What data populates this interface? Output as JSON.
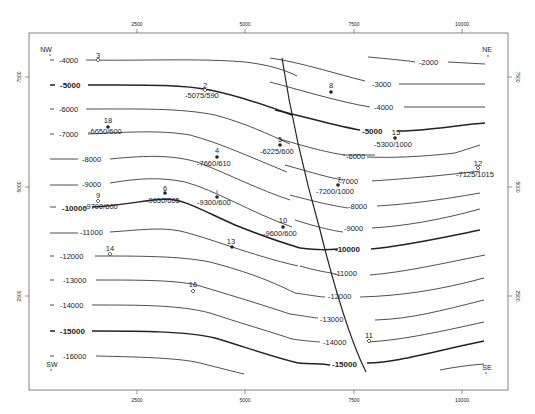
{
  "map": {
    "title": "Structure contour map",
    "frame": {
      "left": 29,
      "right": 508,
      "top": 33,
      "bottom": 390
    },
    "x_axis": {
      "ticks": [
        {
          "value": "2500",
          "px": 137
        },
        {
          "value": "5000",
          "px": 245
        },
        {
          "value": "7500",
          "px": 354
        },
        {
          "value": "10000",
          "px": 462
        }
      ]
    },
    "y_axis": {
      "ticks": [
        {
          "value": "7500",
          "py": 77
        },
        {
          "value": "5000",
          "py": 187
        },
        {
          "value": "2500",
          "py": 296
        }
      ]
    },
    "corners": {
      "nw": "NW",
      "ne": "NE",
      "sw": "SW",
      "se": "SE"
    },
    "contour_interval": 1000,
    "contours": [
      {
        "value": "-2000",
        "major": false
      },
      {
        "value": "-3000",
        "major": false
      },
      {
        "value": "-4000",
        "major": false
      },
      {
        "value": "-5000",
        "major": true
      },
      {
        "value": "-6000",
        "major": false
      },
      {
        "value": "-7000",
        "major": false
      },
      {
        "value": "-8000",
        "major": false
      },
      {
        "value": "-9000",
        "major": false
      },
      {
        "value": "-10000",
        "major": true
      },
      {
        "value": "-11000",
        "major": false
      },
      {
        "value": "-12000",
        "major": false
      },
      {
        "value": "-13000",
        "major": false
      },
      {
        "value": "-14000",
        "major": false
      },
      {
        "value": "-15000",
        "major": true
      },
      {
        "value": "-16000",
        "major": false
      }
    ],
    "left_labels": {
      "c4000": "-4000",
      "c5000": "-5000",
      "c6000": "-6000",
      "c7000": "-7000",
      "c8000": "-8000",
      "c9000": "-9000",
      "c10000": "-10000",
      "c11000": "-11000",
      "c12000": "-12000",
      "c13000": "-13000",
      "c14000": "-14000",
      "c15000": "-15000",
      "c16000": "-16000"
    },
    "right_labels": {
      "c2000": "-2000",
      "c3000": "-3000",
      "c4000": "-4000",
      "c5000": "-5000",
      "c6000": "-6000",
      "c7000": "-7000",
      "c8000": "-8000",
      "c9000": "-9000",
      "c10000": "-10000",
      "c11000": "-11000",
      "c12000": "-12000",
      "c13000": "-13000",
      "c14000": "-14000",
      "c15000": "-15000"
    },
    "wells": [
      {
        "id": "3",
        "symbol": "dry",
        "annotation": ""
      },
      {
        "id": "2",
        "symbol": "dry",
        "annotation": "-5075/590"
      },
      {
        "id": "8",
        "symbol": "producer",
        "annotation": ""
      },
      {
        "id": "18",
        "symbol": "producer",
        "annotation": "-6650/600"
      },
      {
        "id": "15",
        "symbol": "producer",
        "annotation": "-5300/1000"
      },
      {
        "id": "5",
        "symbol": "producer",
        "annotation": "-6225/600"
      },
      {
        "id": "4",
        "symbol": "producer",
        "annotation": "-7660/610"
      },
      {
        "id": "7",
        "symbol": "producer",
        "annotation": "-7200/1000"
      },
      {
        "id": "12",
        "symbol": "dry",
        "annotation": "-7125/1015"
      },
      {
        "id": "6",
        "symbol": "producer",
        "annotation": "-9650/605"
      },
      {
        "id": "1",
        "symbol": "producer",
        "annotation": "-9300/600"
      },
      {
        "id": "9",
        "symbol": "dry",
        "annotation": "-9700/600"
      },
      {
        "id": "10",
        "symbol": "producer",
        "annotation": "-9600/600"
      },
      {
        "id": "13",
        "symbol": "producer",
        "annotation": ""
      },
      {
        "id": "14",
        "symbol": "dry",
        "annotation": ""
      },
      {
        "id": "16",
        "symbol": "dry",
        "annotation": ""
      },
      {
        "id": "11",
        "symbol": "dry",
        "annotation": ""
      }
    ],
    "fault": {
      "label": "fault-trace"
    },
    "colors": {
      "line": "#222222",
      "frame": "#555555",
      "background": "#ffffff"
    }
  }
}
